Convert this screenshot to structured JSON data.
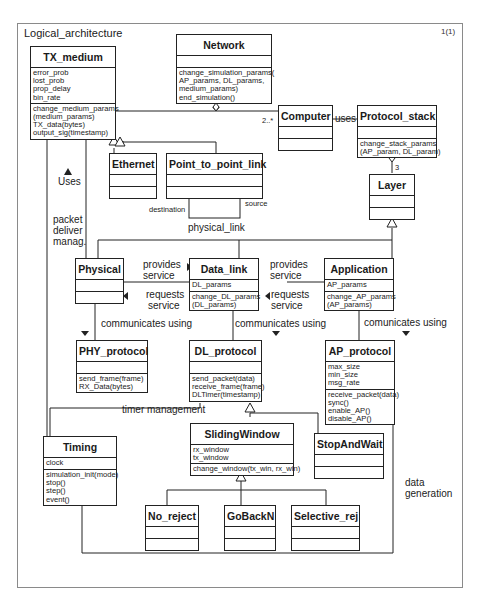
{
  "diagram": {
    "title": "Logical_architecture",
    "page": "1(1)"
  },
  "classes": {
    "tx_medium": {
      "name": "TX_medium",
      "attributes": [
        "error_prob",
        "lost_prob",
        "prop_delay",
        "bin_rate"
      ],
      "operations": [
        "change_medium_params",
        "(medium_params)",
        "TX_data(bytes)",
        "output_sig(timestamp)"
      ]
    },
    "network": {
      "name": "Network",
      "attributes": [],
      "operations": [
        "change_simulation_params(",
        "AP_params, DL_params,",
        "medium_params)",
        "end_simulation()"
      ]
    },
    "computer": {
      "name": "Computer",
      "attributes": [],
      "operations": []
    },
    "protocol_stack": {
      "name": "Protocol_stack",
      "attributes": [],
      "operations": [
        "change_stack_params",
        "(AP_param, DL_param)"
      ]
    },
    "ethernet": {
      "name": "Ethernet",
      "attributes": [],
      "operations": []
    },
    "point_to_point_link": {
      "name": "Point_to_point_link",
      "attributes": [],
      "operations": []
    },
    "layer": {
      "name": "Layer",
      "attributes": [],
      "operations": []
    },
    "physical": {
      "name": "Physical",
      "attributes": [],
      "operations": []
    },
    "data_link": {
      "name": "Data_link",
      "attributes": [
        "DL_params"
      ],
      "operations": [
        "change_DL_params",
        "(DL_params)"
      ]
    },
    "application": {
      "name": "Application",
      "attributes": [
        "AP_params"
      ],
      "operations": [
        "change_AP_params",
        "(AP_params)"
      ]
    },
    "phy_protocol": {
      "name": "PHY_protocol",
      "attributes": [],
      "operations": [
        "send_frame(frame)",
        "RX_Data(bytes)"
      ]
    },
    "dl_protocol": {
      "name": "DL_protocol",
      "attributes": [],
      "operations": [
        "send_packet(data)",
        "receive_frame(frame)",
        "DLTimer(timestamp)"
      ]
    },
    "ap_protocol": {
      "name": "AP_protocol",
      "attributes": [
        "max_size",
        "min_size",
        "msg_rate"
      ],
      "operations": [
        "receive_packet(data)",
        "sync()",
        "enable_AP()",
        "disable_AP()"
      ]
    },
    "timing": {
      "name": "Timing",
      "attributes": [
        "clock"
      ],
      "operations": [
        "simulation_init(mode)",
        "stop()",
        "step()",
        "event()"
      ]
    },
    "sliding_window": {
      "name": "SlidingWindow",
      "attributes": [
        "rx_window",
        "tx_window"
      ],
      "operations": [
        "change_window(tx_win, rx_win)"
      ]
    },
    "stop_and_wait": {
      "name": "StopAndWait",
      "attributes": [],
      "operations": []
    },
    "no_reject": {
      "name": "No_reject",
      "attributes": [],
      "operations": []
    },
    "go_back_n": {
      "name": "GoBackN",
      "attributes": [],
      "operations": []
    },
    "selective_rej": {
      "name": "Selective_rej",
      "attributes": [],
      "operations": []
    }
  },
  "labels": {
    "uses_tx": "Uses",
    "packet_deliver": [
      "packet",
      "deliver",
      "manag."
    ],
    "uses_computer": "uses",
    "multiplicity_computer": "2..*",
    "multiplicity_layer": "3",
    "destination": "destination",
    "source": "source",
    "physical_link": "physical_link",
    "provides_service_1": [
      "provides",
      "service"
    ],
    "requests_service_1": [
      "requests",
      "service"
    ],
    "provides_service_2": [
      "provides",
      "service"
    ],
    "requests_service_2": [
      "requests",
      "service"
    ],
    "communicates_using_1": "communicates using",
    "communicates_using_2": "communicates using",
    "communicates_using_3": "comunicates using",
    "timer_management": "timer management",
    "data_generation": [
      "data",
      "generation"
    ]
  },
  "colors": {
    "line": "#222222",
    "frame": "#8a8a8a",
    "background": "#ffffff"
  }
}
